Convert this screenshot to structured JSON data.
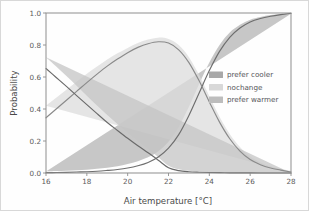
{
  "figure": {
    "background": "#fefefe",
    "border_color": "#d8d8d8"
  },
  "axes": {
    "x_title": "Air temperature [°C]",
    "y_title": "Probability",
    "x_ticks": [
      "16",
      "18",
      "20",
      "22",
      "24",
      "26",
      "28"
    ],
    "y_ticks": [
      "0.0",
      "0.2",
      "0.4",
      "0.6",
      "0.8",
      "1.0"
    ],
    "spine_color": "#8d8d8d",
    "tick_label_color": "#5a5a5a"
  },
  "legend": {
    "entries": [
      {
        "label": "prefer cooler",
        "swatch": "#a8a8a8"
      },
      {
        "label": "nochange",
        "swatch": "#d8d8d8"
      },
      {
        "label": "prefer warmer",
        "swatch": "#bdbdbd"
      }
    ]
  },
  "chart_data": {
    "type": "line",
    "title": "",
    "subtitle": "",
    "xlabel": "Air temperature [°C]",
    "ylabel": "Probability",
    "xlim": [
      16,
      28
    ],
    "ylim": [
      0.0,
      1.0
    ],
    "xticks": [
      16,
      18,
      20,
      22,
      24,
      26,
      28
    ],
    "yticks": [
      0.0,
      0.2,
      0.4,
      0.6,
      0.8,
      1.0
    ],
    "grid": false,
    "legend_position": "center-right",
    "annotations": [],
    "x": [
      16,
      16.5,
      17,
      17.5,
      18,
      18.5,
      19,
      19.5,
      20,
      20.5,
      21,
      21.5,
      22,
      22.5,
      23,
      23.5,
      24,
      24.5,
      25,
      25.5,
      26,
      26.5,
      27,
      27.5,
      28
    ],
    "series": [
      {
        "name": "prefer cooler",
        "color": "#6e6e6e",
        "band_color": "#b4b4b4",
        "values": [
          0.002,
          0.003,
          0.004,
          0.006,
          0.008,
          0.011,
          0.016,
          0.022,
          0.031,
          0.045,
          0.066,
          0.1,
          0.155,
          0.24,
          0.36,
          0.5,
          0.64,
          0.76,
          0.848,
          0.906,
          0.944,
          0.966,
          0.98,
          0.99,
          0.998
        ],
        "lower": [
          0.0,
          0.0,
          0.001,
          0.002,
          0.003,
          0.005,
          0.008,
          0.013,
          0.02,
          0.031,
          0.049,
          0.078,
          0.125,
          0.2,
          0.31,
          0.445,
          0.59,
          0.72,
          0.818,
          0.886,
          0.93,
          0.957,
          0.973,
          0.986,
          0.996
        ],
        "upper": [
          0.01,
          0.012,
          0.014,
          0.017,
          0.021,
          0.026,
          0.033,
          0.042,
          0.056,
          0.074,
          0.098,
          0.136,
          0.196,
          0.288,
          0.414,
          0.556,
          0.69,
          0.8,
          0.878,
          0.926,
          0.958,
          0.975,
          0.987,
          0.994,
          1.0
        ]
      },
      {
        "name": "nochange",
        "color": "#8a8a8a",
        "band_color": "#dcdcdc",
        "values": [
          0.345,
          0.4,
          0.455,
          0.51,
          0.565,
          0.618,
          0.668,
          0.712,
          0.752,
          0.785,
          0.808,
          0.82,
          0.812,
          0.77,
          0.69,
          0.576,
          0.444,
          0.318,
          0.214,
          0.137,
          0.084,
          0.052,
          0.031,
          0.018,
          0.006
        ],
        "lower": [
          0.27,
          0.33,
          0.39,
          0.45,
          0.51,
          0.57,
          0.625,
          0.675,
          0.72,
          0.755,
          0.782,
          0.795,
          0.785,
          0.74,
          0.655,
          0.54,
          0.408,
          0.285,
          0.186,
          0.115,
          0.068,
          0.04,
          0.022,
          0.011,
          0.002
        ],
        "upper": [
          0.42,
          0.47,
          0.52,
          0.57,
          0.62,
          0.666,
          0.71,
          0.748,
          0.782,
          0.812,
          0.834,
          0.846,
          0.838,
          0.8,
          0.724,
          0.612,
          0.48,
          0.352,
          0.244,
          0.162,
          0.103,
          0.066,
          0.042,
          0.026,
          0.012
        ]
      },
      {
        "name": "prefer warmer",
        "color": "#6a6a6a",
        "band_color": "#c4c4c4",
        "values": [
          0.653,
          0.597,
          0.541,
          0.484,
          0.427,
          0.371,
          0.316,
          0.266,
          0.217,
          0.17,
          0.126,
          0.08,
          0.033,
          0.015,
          0.008,
          0.005,
          0.003,
          0.002,
          0.001,
          0.001,
          0.001,
          0.0,
          0.0,
          0.0,
          0.0
        ],
        "lower": [
          0.578,
          0.527,
          0.476,
          0.424,
          0.372,
          0.322,
          0.273,
          0.228,
          0.184,
          0.142,
          0.103,
          0.063,
          0.024,
          0.009,
          0.004,
          0.002,
          0.001,
          0.001,
          0.0,
          0.0,
          0.0,
          0.0,
          0.0,
          0.0,
          0.0
        ],
        "upper": [
          0.724,
          0.666,
          0.606,
          0.545,
          0.483,
          0.422,
          0.362,
          0.306,
          0.252,
          0.2,
          0.151,
          0.099,
          0.046,
          0.024,
          0.014,
          0.009,
          0.006,
          0.004,
          0.003,
          0.002,
          0.002,
          0.001,
          0.001,
          0.001,
          0.0
        ]
      }
    ]
  }
}
